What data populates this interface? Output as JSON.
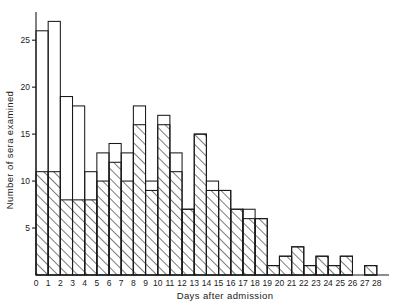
{
  "chart_data": {
    "type": "bar",
    "title": "",
    "xlabel": "Days after  admission",
    "ylabel": "Number of sera examined",
    "xlim": [
      0,
      29
    ],
    "ylim": [
      0,
      28
    ],
    "grid": false,
    "legend": null,
    "x_tick_labels": [
      "0",
      "1",
      "2",
      "3",
      "4",
      "5",
      "6",
      "7",
      "8",
      "9",
      "10",
      "11",
      "12",
      "13",
      "14",
      "15",
      "16",
      "17",
      "18",
      "19",
      "20",
      "21",
      "22",
      "23",
      "24",
      "25",
      "26",
      "27",
      "28"
    ],
    "y_tick_labels": [
      "5",
      "10",
      "15",
      "20",
      "25"
    ],
    "y_ticks": [
      5,
      10,
      15,
      20,
      25
    ],
    "categories": [
      "0",
      "1",
      "2",
      "3",
      "4",
      "5",
      "6",
      "7",
      "8",
      "9",
      "10",
      "11",
      "12",
      "13",
      "14",
      "15",
      "16",
      "17",
      "18",
      "19",
      "20",
      "21",
      "22",
      "23",
      "24",
      "25",
      "26",
      "27",
      "28"
    ],
    "series": [
      {
        "name": "hatched (lower portion)",
        "fill": "diagonal-hatch",
        "values": [
          11,
          11,
          8,
          8,
          8,
          10,
          12,
          10,
          16,
          9,
          16,
          11,
          7,
          15,
          9,
          9,
          7,
          6,
          6,
          1,
          2,
          3,
          1,
          2,
          1,
          2,
          0,
          1,
          0
        ]
      },
      {
        "name": "total (open outline)",
        "fill": "open",
        "values": [
          26,
          27,
          19,
          18,
          11,
          13,
          14,
          13,
          18,
          10,
          17,
          13,
          7,
          15,
          10,
          9,
          7,
          7,
          6,
          1,
          2,
          3,
          1,
          2,
          1,
          2,
          0,
          1,
          0
        ]
      }
    ]
  },
  "axes": {
    "y_axis_label": "Number of sera examined",
    "x_axis_label": "Days after  admission"
  }
}
